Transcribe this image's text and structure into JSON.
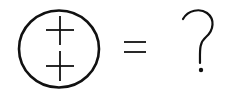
{
  "puzzle": {
    "lhs": {
      "shape": "circle",
      "contents": [
        "plus",
        "plus"
      ],
      "stroke_color": "#111111"
    },
    "operator": "=",
    "rhs": "?"
  },
  "colors": {
    "background": "#ffffff",
    "ink": "#111111"
  }
}
